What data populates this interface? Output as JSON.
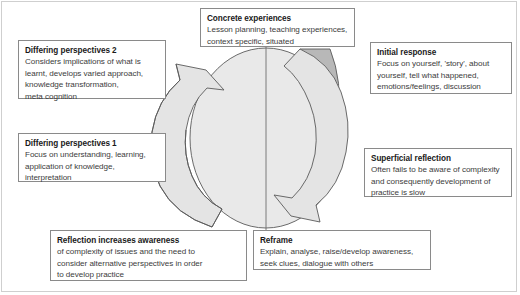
{
  "diagram": {
    "name": "reflective-practice-cycle",
    "colors": {
      "circle_fill": "#e9e9e9",
      "arrow_fill": "#e4e4e4",
      "wedge_fill": "#b8b8b8",
      "stroke": "#5a5a5a",
      "box_border": "#8a8a8a",
      "frame_border": "#cfcfcf",
      "title_text": "#1a1a1a",
      "body_text": "#3c3c3c",
      "background": "#ffffff"
    },
    "shapes": {
      "circle": "light-grey-circle",
      "left_arrow": "curved-arrow-counterclockwise-up",
      "right_arrow": "curved-arrow-clockwise-down",
      "wedge": "shaded-wedge-top-right",
      "center_line": "vertical-divider-line"
    }
  },
  "boxes": {
    "differing_perspectives_2": {
      "title": "Differing perspectives 2",
      "lines": [
        "Considers implications of what is",
        "learnt, develops varied approach,",
        "knowledge transformation,",
        "meta cognition"
      ]
    },
    "differing_perspectives_1": {
      "title": "Differing perspectives 1",
      "lines": [
        "Focus on understanding, learning,",
        "application of knowledge,",
        "interpretation"
      ]
    },
    "concrete_experiences": {
      "title": "Concrete experiences",
      "lines": [
        "Lesson planning, teaching experiences,",
        "context specific, situated"
      ]
    },
    "initial_response": {
      "title": "Initial response",
      "lines": [
        "Focus on yourself, 'story', about",
        "yourself, tell what happened,",
        "emotions/feelings, discussion"
      ]
    },
    "superficial_reflection": {
      "title": "Superficial reflection",
      "lines": [
        "Often fails to be aware of complexity",
        "and consequently development of",
        "practice is slow"
      ]
    },
    "reflection_increases_awareness": {
      "title": "Reflection increases awareness",
      "lines": [
        "of complexity of issues and  the need to",
        "consider alternative perspectives in order",
        "to develop practice"
      ]
    },
    "reframe": {
      "title": "Reframe",
      "lines": [
        "Explain, analyse, raise/develop awareness,",
        "seek clues, dialogue with others"
      ]
    }
  }
}
